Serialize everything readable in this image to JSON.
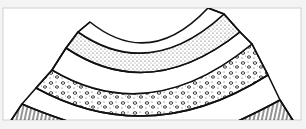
{
  "figure": {
    "type": "geological-fold-cross-section",
    "layers": [
      {
        "name": "top-layer",
        "pattern": "blank"
      },
      {
        "name": "sandstone-layer",
        "pattern": "fine-dots"
      },
      {
        "name": "shale-layer",
        "pattern": "blank"
      },
      {
        "name": "conglomerate-layer",
        "pattern": "pebbles-and-dots"
      },
      {
        "name": "lower-blank-layer",
        "pattern": "blank"
      },
      {
        "name": "striped-layer",
        "pattern": "vertical-lines"
      }
    ],
    "colors": {
      "line": "#111111",
      "background": "#ffffff",
      "page": "#f4f4f4"
    }
  },
  "caption": {
    "text": ""
  }
}
